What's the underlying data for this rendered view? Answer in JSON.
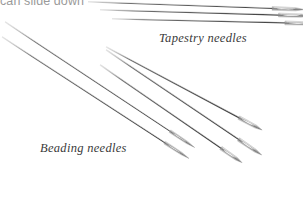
{
  "page": {
    "background_color": "#ffffff",
    "width": 303,
    "height": 223
  },
  "captions": {
    "clipped_top_caption": "can slide down",
    "clipped_top_caption_color": "#9a9a9a"
  },
  "labels": {
    "tapestry": "Tapestry needles",
    "beading": "Beading needles",
    "label_color": "#3a3a3a"
  },
  "needles": {
    "steel_color": "#8d8d8d",
    "steel_dark": "#4a4a4a",
    "steel_light": "#d8d8d8",
    "tapestry_horizontal_count": 3,
    "tapestry_diagonal_count": 3,
    "beading_count": 2,
    "total_count": 8
  }
}
